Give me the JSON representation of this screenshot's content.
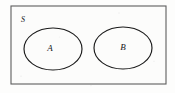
{
  "figure": {
    "kind": "venn-diagram",
    "background_color": "#fdfdfc"
  },
  "universe": {
    "label": "S",
    "shape": "rectangle",
    "stroke_color": "#5d5d5d",
    "fill_color": "#fcfcfb",
    "x": 11,
    "y": 6,
    "width": 155,
    "height": 78,
    "label_x": 23,
    "label_y": 20
  },
  "sets": [
    {
      "label": "A",
      "shape": "ellipse",
      "stroke_color": "#1a1a1a",
      "cx": 53,
      "cy": 49,
      "rx": 29,
      "ry": 21,
      "label_x": 50,
      "label_y": 49
    },
    {
      "label": "B",
      "shape": "ellipse",
      "stroke_color": "#1a1a1a",
      "cx": 123,
      "cy": 48,
      "rx": 29,
      "ry": 21,
      "label_x": 123,
      "label_y": 48
    }
  ]
}
